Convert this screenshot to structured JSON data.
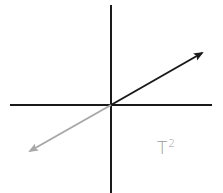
{
  "diagram": {
    "label": {
      "base": "T",
      "exponent": "2"
    },
    "colors": {
      "axes": "#1a1a1a",
      "vector_primary": "#1a1a1a",
      "vector_secondary": "#a8a8a8",
      "label": "#9a9a9a"
    },
    "axes": {
      "horizontal": {
        "x1": 10,
        "y1": 105,
        "x2": 212,
        "y2": 105
      },
      "vertical": {
        "x1": 111,
        "y1": 5,
        "x2": 111,
        "y2": 193
      }
    },
    "vectors": [
      {
        "name": "vector-up-right",
        "from": [
          111,
          105
        ],
        "to": [
          203,
          52
        ],
        "color": "#1a1a1a"
      },
      {
        "name": "vector-down-left",
        "from": [
          111,
          105
        ],
        "to": [
          29,
          152
        ],
        "color": "#a8a8a8"
      }
    ]
  }
}
